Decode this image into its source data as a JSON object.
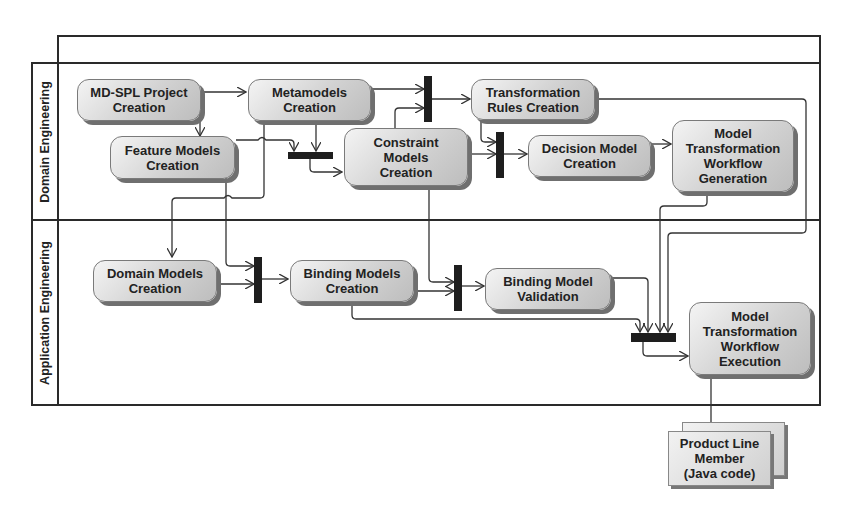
{
  "diagram": {
    "type": "UML activity diagram with swimlanes",
    "lanes": [
      {
        "id": "domain",
        "label": "Domain Engineering"
      },
      {
        "id": "application",
        "label": "Application Engineering"
      }
    ],
    "nodes": {
      "mdspl": "MD-SPL Project\nCreation",
      "metamodels": "Metamodels\nCreation",
      "transform_rules": "Transformation\nRules Creation",
      "feature_models": "Feature Models\nCreation",
      "constraint_models": "Constraint\nModels\nCreation",
      "decision_model": "Decision Model\nCreation",
      "mtw_generation": "Model\nTransformation\nWorkflow\nGeneration",
      "domain_models": "Domain Models\nCreation",
      "binding_models": "Binding Models\nCreation",
      "binding_validation": "Binding Model\nValidation",
      "mtw_execution": "Model\nTransformation\nWorkflow\nExecution"
    },
    "artifact": "Product Line\nMember\n(Java code)",
    "sync_bars": [
      "join-metamodels-feature",
      "fork-transformation-rules",
      "join-decision-model",
      "join-binding-models",
      "join-binding-validation",
      "join-workflow-execution"
    ],
    "edges": [
      [
        "MD-SPL Project Creation",
        "Metamodels Creation"
      ],
      [
        "MD-SPL Project Creation",
        "Feature Models Creation"
      ],
      [
        "Metamodels Creation",
        "sync bar (transformation rules)"
      ],
      [
        "Constraint Models Creation",
        "sync bar (transformation rules)"
      ],
      [
        "sync bar (transformation rules)",
        "Transformation Rules Creation"
      ],
      [
        "Feature Models Creation",
        "sync bar (constraints)"
      ],
      [
        "Metamodels Creation",
        "sync bar (constraints)"
      ],
      [
        "sync bar (constraints)",
        "Constraint Models Creation"
      ],
      [
        "Transformation Rules Creation",
        "sync bar (decision)"
      ],
      [
        "Constraint Models Creation",
        "sync bar (decision)"
      ],
      [
        "sync bar (decision)",
        "Decision Model Creation"
      ],
      [
        "Decision Model Creation",
        "Model Transformation Workflow Generation"
      ],
      [
        "Metamodels Creation",
        "Domain Models Creation"
      ],
      [
        "Feature Models Creation",
        "sync bar (binding)"
      ],
      [
        "Domain Models Creation",
        "sync bar (binding)"
      ],
      [
        "sync bar (binding)",
        "Binding Models Creation"
      ],
      [
        "Constraint Models Creation",
        "sync bar (validation)"
      ],
      [
        "Binding Models Creation",
        "sync bar (validation)"
      ],
      [
        "sync bar (validation)",
        "Binding Model Validation"
      ],
      [
        "Binding Models Creation",
        "sync bar (execution)"
      ],
      [
        "Binding Model Validation",
        "sync bar (execution)"
      ],
      [
        "Model Transformation Workflow Generation",
        "sync bar (execution)"
      ],
      [
        "Transformation Rules Creation",
        "sync bar (execution)"
      ],
      [
        "sync bar (execution)",
        "Model Transformation Workflow Execution"
      ],
      [
        "Model Transformation Workflow Execution",
        "Product Line Member (Java code)"
      ]
    ]
  }
}
